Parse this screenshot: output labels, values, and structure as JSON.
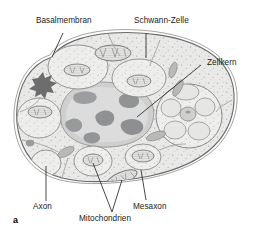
{
  "figure": {
    "panel_letter": "a",
    "type": "histology-diagram",
    "background_color": "#ffffff",
    "line_color": "#5a5a5a",
    "text_color": "#222222",
    "cytoplasm_color": "#e8e8e6",
    "nucleus_color": "#cfcfcf",
    "chromatin_color": "#8f9192",
    "axon_fill_color": "#ebebe9",
    "dark_body_color": "#6d6d6d"
  },
  "labels": [
    {
      "id": "basalmembran",
      "text": "Basalmembran",
      "x": 36,
      "y": 22,
      "leader": {
        "x1": 63,
        "y1": 33,
        "x2": 52,
        "y2": 57
      }
    },
    {
      "id": "schwann-zelle",
      "text": "Schwann-Zelle",
      "x": 136,
      "y": 22,
      "leader": {
        "x1": 146,
        "y1": 33,
        "x2": 146,
        "y2": 58
      }
    },
    {
      "id": "zellkern",
      "text": "Zellkern",
      "x": 204,
      "y": 62,
      "leader": {
        "x1": 201,
        "y1": 65,
        "x2": 137,
        "y2": 117
      }
    },
    {
      "id": "axon",
      "text": "Axon",
      "x": 39,
      "y": 203,
      "leader": {
        "x1": 46,
        "y1": 201,
        "x2": 46,
        "y2": 166
      }
    },
    {
      "id": "mitochondrien",
      "text": "Mitochondrien",
      "x": 81,
      "y": 216,
      "leader": {
        "x1": 112,
        "y1": 212,
        "x2": 93,
        "y2": 163
      }
    },
    {
      "id": "mitochondrien-2",
      "text": "",
      "x": 0,
      "y": 0,
      "leader": {
        "x1": 112,
        "y1": 212,
        "x2": 120,
        "y2": 180
      }
    },
    {
      "id": "mesaxon",
      "text": "Mesaxon",
      "x": 135,
      "y": 203,
      "leader": {
        "x1": 146,
        "y1": 200,
        "x2": 140,
        "y2": 172
      }
    }
  ],
  "structures": {
    "cell_outline": "rounded irregular Schwann cell body",
    "nucleus": "large irregular pale nucleus with dark chromatin clumps",
    "axons": "multiple unmyelinated axon profiles in compartments",
    "mitochondria": "striped elongated organelles with cristae",
    "dense_body": "dark star-shaped inclusion left side",
    "axon_cluster": "grouped small axon profiles right side"
  }
}
